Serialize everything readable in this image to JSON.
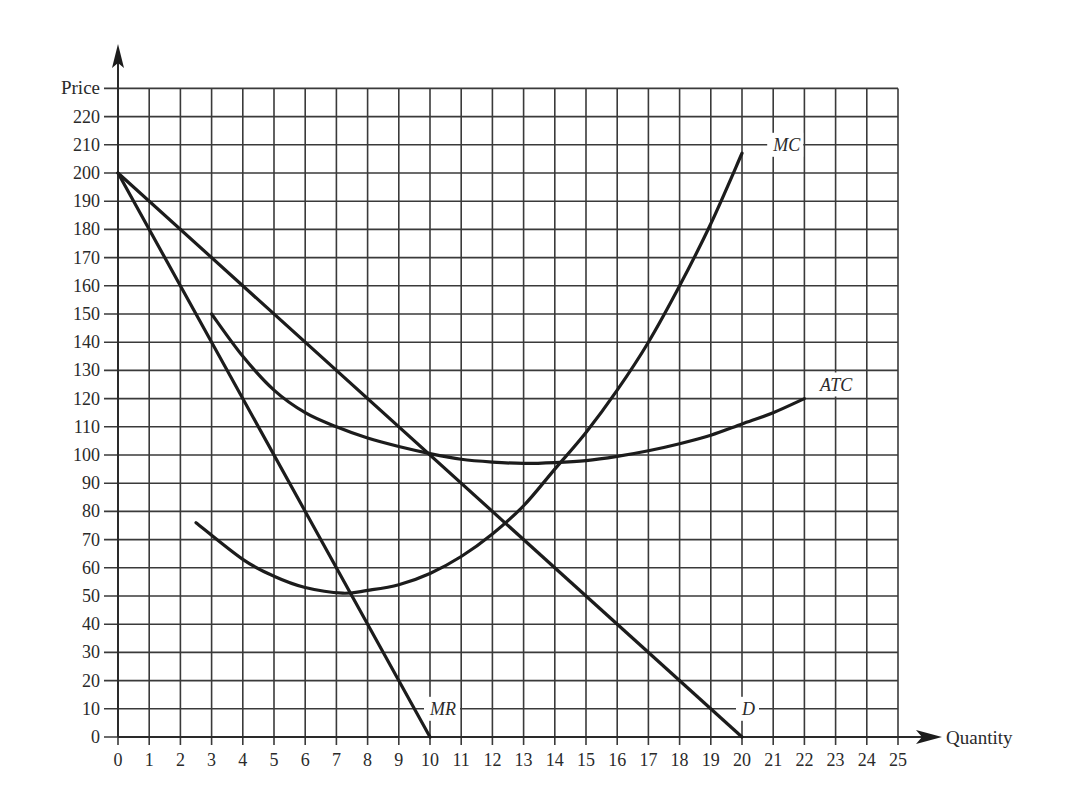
{
  "chart_data": {
    "type": "line",
    "title": "",
    "xlabel": "Quantity",
    "ylabel": "Price",
    "xlim": [
      0,
      25
    ],
    "ylim": [
      0,
      230
    ],
    "grid": true,
    "x_ticks": [
      0,
      1,
      2,
      3,
      4,
      5,
      6,
      7,
      8,
      9,
      10,
      11,
      12,
      13,
      14,
      15,
      16,
      17,
      18,
      19,
      20,
      21,
      22,
      23,
      24,
      25
    ],
    "y_ticks": [
      0,
      10,
      20,
      30,
      40,
      50,
      60,
      70,
      80,
      90,
      100,
      110,
      120,
      130,
      140,
      150,
      160,
      170,
      180,
      190,
      200,
      210,
      220
    ],
    "series": [
      {
        "name": "D",
        "label_at": [
          20,
          10
        ],
        "points": [
          [
            0,
            200
          ],
          [
            20,
            0
          ]
        ]
      },
      {
        "name": "MR",
        "label_at": [
          10,
          10
        ],
        "points": [
          [
            0,
            200
          ],
          [
            10,
            0
          ]
        ]
      },
      {
        "name": "MC",
        "label_at": [
          21,
          210
        ],
        "points": [
          [
            2.5,
            76
          ],
          [
            4,
            63
          ],
          [
            5,
            57
          ],
          [
            6,
            53
          ],
          [
            7.2,
            51
          ],
          [
            8,
            52
          ],
          [
            9,
            54
          ],
          [
            10,
            58
          ],
          [
            11,
            64
          ],
          [
            12,
            72
          ],
          [
            13,
            82
          ],
          [
            14,
            95
          ],
          [
            15,
            108
          ],
          [
            16,
            123
          ],
          [
            17,
            140
          ],
          [
            18,
            160
          ],
          [
            19,
            182
          ],
          [
            20,
            207
          ]
        ]
      },
      {
        "name": "ATC",
        "label_at": [
          22.5,
          125
        ],
        "points": [
          [
            3,
            150
          ],
          [
            4,
            135
          ],
          [
            5,
            123
          ],
          [
            6,
            115
          ],
          [
            7,
            110
          ],
          [
            8,
            106
          ],
          [
            9,
            103
          ],
          [
            10,
            100.5
          ],
          [
            11,
            98.5
          ],
          [
            12,
            97.5
          ],
          [
            13,
            97
          ],
          [
            14,
            97.3
          ],
          [
            15,
            98
          ],
          [
            16,
            99.5
          ],
          [
            17,
            101.5
          ],
          [
            18,
            104
          ],
          [
            19,
            107
          ],
          [
            20,
            111
          ],
          [
            21,
            115
          ],
          [
            22,
            120
          ]
        ]
      }
    ]
  },
  "axes": {
    "x_title": "Quantity",
    "y_title": "Price"
  }
}
